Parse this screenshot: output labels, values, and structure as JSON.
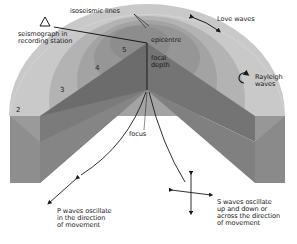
{
  "diagram": {
    "labels": {
      "isoseismic_lines": "isoseismic lines",
      "seismograph": "seismograph in\nrecording station",
      "epicentre": "epicentre",
      "focal_depth": "focal\ndepth",
      "focus": "focus",
      "love_waves": "Love waves",
      "rayleigh_waves": "Rayleigh\nwaves",
      "p_waves": "P waves oscillate\nin the direction\nof movement",
      "s_waves": "S waves oscillate\nup and down or\nacross the direction\nof movement"
    },
    "intensity_rings": [
      "2",
      "3",
      "4",
      "5"
    ],
    "icons": {
      "seismograph": "triangle-outline",
      "love_waves": "double-arrow-curved",
      "rayleigh_waves": "circular-arrow",
      "p_waves": "double-arrow-diagonal",
      "s_waves": "four-way-cross-arrow"
    },
    "colors": {
      "ring_outer": "#c8c8c8",
      "ring_2": "#b4b4b4",
      "ring_3": "#a4a4a4",
      "ring_4": "#979797",
      "ring_5": "#8a8a8a",
      "wedge_dark": "#6e6e6e",
      "block_front": "#8c8c8c",
      "block_side": "#7a7a7a",
      "line": "#1a1a1a"
    }
  }
}
